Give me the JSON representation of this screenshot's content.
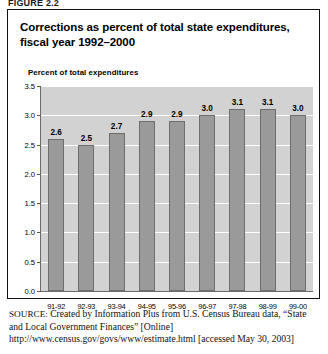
{
  "figure": {
    "caption": "FIGURE 2.2"
  },
  "chart_data": {
    "type": "bar",
    "title": "Corrections as percent of total state expenditures, fiscal year 1992–2000",
    "title_lines": [
      "Corrections as percent of total state expenditures,",
      "fiscal year 1992–2000"
    ],
    "ylabel": "Percent of total expenditures",
    "xlabel": "",
    "categories": [
      "91-92",
      "92-93",
      "93-94",
      "94-95",
      "95-96",
      "96-97",
      "97-98",
      "98-99",
      "99-00"
    ],
    "values": [
      2.6,
      2.5,
      2.7,
      2.9,
      2.9,
      3.0,
      3.1,
      3.1,
      3.0
    ],
    "data_labels": [
      "2.6",
      "2.5",
      "2.7",
      "2.9",
      "2.9",
      "3.0",
      "3.1",
      "3.1",
      "3.0"
    ],
    "ylim": [
      0.0,
      3.5
    ],
    "ytick_values": [
      0.0,
      0.5,
      1.0,
      1.5,
      2.0,
      2.5,
      3.0,
      3.5
    ],
    "ytick_labels": [
      "0.0",
      "0.5",
      "1.0",
      "1.5",
      "2.0",
      "2.5",
      "3.0",
      "3.5"
    ],
    "grid": true,
    "legend": false,
    "legend_position": "none",
    "colors": {
      "bar_fill": "#9a9a9a",
      "bar_border": "#6e6e6e",
      "plot_background": "#d2d2d2",
      "gridline": "#ffffff",
      "axis": "#6b6c70",
      "text": "#000000",
      "frame_border": "#111111"
    }
  },
  "source": {
    "label": "SOURCE:",
    "text": " Created by Information Plus from U.S. Census Bureau data, “State and Local Government Finances” [Online] http://www.census.gov/govs/www/estimate.html [accessed May 30, 2003]"
  }
}
